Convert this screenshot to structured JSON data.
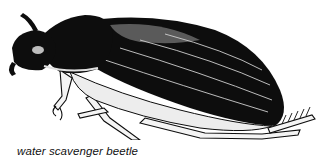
{
  "figure": {
    "subject": "water scavenger beetle",
    "style": "black-and-white ink illustration",
    "colors": {
      "ink": "#0d0d0d",
      "paper": "#ffffff",
      "highlight": "#e8e8e8"
    }
  },
  "caption": {
    "text": "water scavenger beetle"
  }
}
